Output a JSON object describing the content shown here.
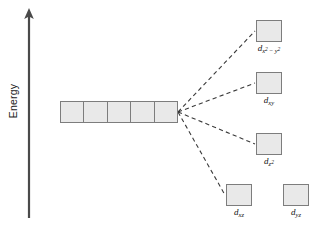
{
  "diagram": {
    "type": "crystal-field-splitting",
    "background_color": "#ffffff",
    "box_fill_color": "#e9e9e9",
    "box_border_color": "#7d7d7d",
    "connector_color": "#3a3a3a",
    "connector_style": "dashed"
  },
  "axis": {
    "label": "Energy",
    "orientation": "vertical",
    "arrow_direction": "up"
  },
  "degenerate_set": {
    "name": "free-ion-d-orbitals",
    "box_count": 5,
    "boxes": [
      {
        "label": ""
      },
      {
        "label": ""
      },
      {
        "label": ""
      },
      {
        "label": ""
      },
      {
        "label": ""
      }
    ]
  },
  "split_levels": [
    {
      "id": "dx2-y2",
      "label_base": "d",
      "label_sub": "x",
      "label_sub_sup": "2",
      "label_op": " − ",
      "label_sub2": "y",
      "label_sub2_sup": "2",
      "label_plain": "dx2−y2",
      "x": 256,
      "y": 20,
      "connected": true,
      "energy_rank": 1
    },
    {
      "id": "dxy",
      "label_base": "d",
      "label_sub": "xy",
      "label_plain": "dxy",
      "x": 256,
      "y": 72,
      "connected": true,
      "energy_rank": 2
    },
    {
      "id": "dz2",
      "label_base": "d",
      "label_sub": "z",
      "label_sub_sup": "2",
      "label_plain": "dz2",
      "x": 256,
      "y": 133,
      "connected": true,
      "energy_rank": 3
    },
    {
      "id": "dxz",
      "label_base": "d",
      "label_sub": "xz",
      "label_plain": "dxz",
      "x": 226,
      "y": 184,
      "connected": true,
      "energy_rank": 4
    },
    {
      "id": "dyz",
      "label_base": "d",
      "label_sub": "yz",
      "label_plain": "dyz",
      "x": 283,
      "y": 184,
      "connected": false,
      "energy_rank": 4
    }
  ]
}
